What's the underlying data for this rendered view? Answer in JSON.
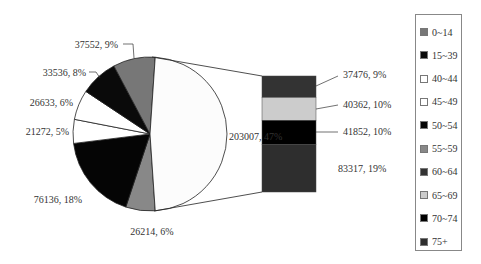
{
  "chart_data": {
    "type": "pie",
    "subtype": "bar-of-pie",
    "title": "",
    "pie_slices": [
      {
        "name": "0~14",
        "value": 37552,
        "percent": "9%",
        "label": "37552, 9%",
        "color": "#777777"
      },
      {
        "name": "15~39",
        "value": 33536,
        "percent": "8%",
        "label": "33536, 8%",
        "color": "#0a0a0a"
      },
      {
        "name": "40~44",
        "value": 26633,
        "percent": "6%",
        "label": "26633, 6%",
        "color": "#ffffff"
      },
      {
        "name": "45~49",
        "value": 21272,
        "percent": "5%",
        "label": "21272, 5%",
        "color": "#ffffff"
      },
      {
        "name": "50~54",
        "value": 76136,
        "percent": "18%",
        "label": "76136, 18%",
        "color": "#050505"
      },
      {
        "name": "55~59",
        "value": 26214,
        "percent": "6%",
        "label": "26214, 6%",
        "color": "#888888"
      },
      {
        "name": "60+ (combined)",
        "value": 203007,
        "percent": "47%",
        "label": "203007, 47%",
        "color": "#fcfcfc"
      }
    ],
    "bar_segments": [
      {
        "name": "60~64",
        "value": 37476,
        "percent": "9%",
        "label": "37476, 9%",
        "color": "#333333"
      },
      {
        "name": "65~69",
        "value": 40362,
        "percent": "10%",
        "label": "40362, 10%",
        "color": "#cccccc"
      },
      {
        "name": "70~74",
        "value": 41852,
        "percent": "10%",
        "label": "41852, 10%",
        "color": "#000000"
      },
      {
        "name": "75+",
        "value": 83317,
        "percent": "19%",
        "label": "83317, 19%",
        "color": "#2e2e2e"
      }
    ],
    "legend": [
      "0~14",
      "15~39",
      "40~44",
      "45~49",
      "50~54",
      "55~59",
      "60~64",
      "65~69",
      "70~74",
      "75+"
    ],
    "legend_colors": [
      "#777777",
      "#0a0a0a",
      "#ffffff",
      "#ffffff",
      "#050505",
      "#888888",
      "#333333",
      "#cccccc",
      "#000000",
      "#2e2e2e"
    ],
    "legend_position": "right"
  }
}
